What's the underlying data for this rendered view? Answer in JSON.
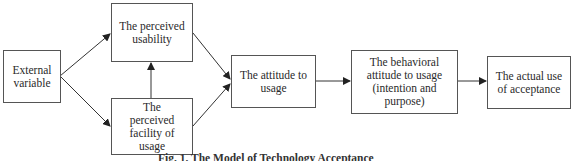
{
  "diagram": {
    "nodes": [
      {
        "id": "external",
        "label": "External variable"
      },
      {
        "id": "usability",
        "label": "The perceived usability"
      },
      {
        "id": "facility",
        "label": "The perceived facility of usage"
      },
      {
        "id": "attitude",
        "label": "The attitude to usage"
      },
      {
        "id": "behavioral",
        "label": "The behavioral attitude to usage (intention and purpose)"
      },
      {
        "id": "actual",
        "label": "The actual use of acceptance"
      }
    ],
    "edges": [
      {
        "from": "external",
        "to": "usability"
      },
      {
        "from": "external",
        "to": "facility"
      },
      {
        "from": "facility",
        "to": "usability"
      },
      {
        "from": "usability",
        "to": "attitude"
      },
      {
        "from": "facility",
        "to": "attitude"
      },
      {
        "from": "attitude",
        "to": "behavioral"
      },
      {
        "from": "behavioral",
        "to": "actual"
      }
    ],
    "caption": "Fig. 1. The Model of Technology Acceptance"
  }
}
